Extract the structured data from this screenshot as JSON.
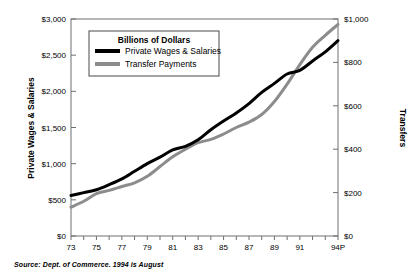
{
  "figure": {
    "source_note": "Source:  Dept. of Commerce. 1994 is August"
  },
  "legend": {
    "title": "Billions of Dollars",
    "entries": [
      {
        "label": "Private Wages & Salaries",
        "color": "#000000"
      },
      {
        "label": "Transfer Payments",
        "color": "#8c8c8c"
      }
    ]
  },
  "axes": {
    "left_title": "Private Wages & Salaries",
    "right_title": "Transfers",
    "left_ticks": [
      "$0",
      "$500",
      "$1,000",
      "$1,500",
      "$2,000",
      "$2,500",
      "$3,000"
    ],
    "right_ticks": [
      "$0",
      "$200",
      "$400",
      "$600",
      "$800",
      "$1,000"
    ],
    "x_ticks": [
      "73",
      "75",
      "77",
      "79",
      "81",
      "83",
      "85",
      "87",
      "89",
      "91",
      "94P"
    ]
  },
  "chart_data": {
    "type": "line",
    "title": "Billions of Dollars",
    "xlabel": "",
    "ylabel": "Private Wages & Salaries",
    "y2label": "Transfers",
    "grid": false,
    "legend_position": "upper-left-inside",
    "x": [
      1973,
      1974,
      1975,
      1976,
      1977,
      1978,
      1979,
      1980,
      1981,
      1982,
      1983,
      1984,
      1985,
      1986,
      1987,
      1988,
      1989,
      1990,
      1991,
      1992,
      1993,
      1994
    ],
    "xtick_values": [
      1973,
      1975,
      1977,
      1979,
      1981,
      1983,
      1985,
      1987,
      1989,
      1991,
      1994
    ],
    "xtick_labels": [
      "73",
      "75",
      "77",
      "79",
      "81",
      "83",
      "85",
      "87",
      "89",
      "91",
      "94P"
    ],
    "xlim": [
      1973,
      1994
    ],
    "ylim": [
      0,
      3000
    ],
    "y2lim": [
      0,
      1000
    ],
    "ytick_values": [
      0,
      500,
      1000,
      1500,
      2000,
      2500,
      3000
    ],
    "ytick_labels": [
      "$0",
      "$500",
      "$1,000",
      "$1,500",
      "$2,000",
      "$2,500",
      "$3,000"
    ],
    "y2tick_values": [
      0,
      200,
      400,
      600,
      800,
      1000
    ],
    "y2tick_labels": [
      "$0",
      "$200",
      "$400",
      "$600",
      "$800",
      "$1,000"
    ],
    "series": [
      {
        "name": "Private Wages & Salaries",
        "axis": "left",
        "color": "#000000",
        "values": [
          560,
          600,
          640,
          710,
          790,
          895,
          1000,
          1090,
          1190,
          1240,
          1330,
          1470,
          1590,
          1700,
          1830,
          1985,
          2110,
          2240,
          2290,
          2420,
          2545,
          2700
        ]
      },
      {
        "name": "Transfer Payments",
        "axis": "right",
        "color": "#8c8c8c",
        "values": [
          133,
          160,
          195,
          210,
          228,
          245,
          275,
          320,
          365,
          400,
          430,
          445,
          470,
          500,
          525,
          560,
          620,
          700,
          790,
          870,
          925,
          975
        ]
      }
    ],
    "annotations": []
  }
}
